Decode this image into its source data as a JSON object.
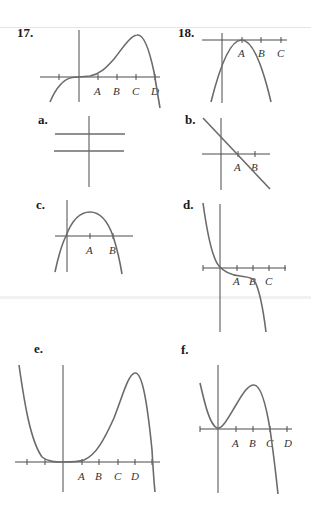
{
  "page": {
    "separator_color": "#e4e4e4",
    "curve_color": "#6b6b6b",
    "axis_color": "#4a4a4a"
  },
  "problems": [
    {
      "id": "17",
      "label": "17.",
      "description": "Graph of f: flat at origin (inflection), rises to local maximum above C, crosses x-axis at D",
      "tick_labels": [
        "A",
        "B",
        "C",
        "D"
      ]
    },
    {
      "id": "18",
      "label": "18.",
      "description": "Downward parabola with vertex touching x-axis at A",
      "tick_labels": [
        "A",
        "B",
        "C"
      ]
    }
  ],
  "choices": [
    {
      "id": "a",
      "label": "a.",
      "description": "Two horizontal lines (constant functions), one above and one below ... both above/around x-axis region",
      "tick_labels": []
    },
    {
      "id": "b",
      "label": "b.",
      "description": "Decreasing straight line crossing x-axis at A",
      "tick_labels": [
        "A",
        "B"
      ]
    },
    {
      "id": "c",
      "label": "c.",
      "description": "Downward parabola with zeros at 0 and B, vertex above A",
      "tick_labels": [
        "A",
        "B"
      ]
    },
    {
      "id": "d",
      "label": "d.",
      "description": "Decreasing cubic-like curve through origin, plateau between A and B",
      "tick_labels": [
        "A",
        "B",
        "C"
      ]
    },
    {
      "id": "e",
      "label": "e.",
      "description": "Curve high on left, flat at origin, rises to max at D, falls steeply",
      "tick_labels": [
        "A",
        "B",
        "C",
        "D"
      ]
    },
    {
      "id": "f",
      "label": "f.",
      "description": "Curve with local min at origin, local max at B, crosses x-axis at C",
      "tick_labels": [
        "A",
        "B",
        "C",
        "D"
      ]
    }
  ]
}
